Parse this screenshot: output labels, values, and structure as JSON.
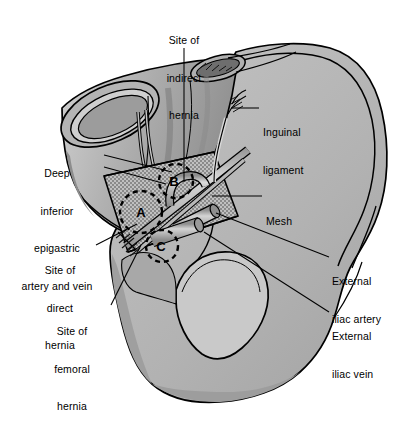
{
  "figure": {
    "kind": "medical-illustration",
    "style": "grayscale line drawing with halftone stipple"
  },
  "palette": {
    "background": "#ffffff",
    "outline": "#000000",
    "bone_fill": "#b4b4b4",
    "bone_fill_light": "#c8c8c8",
    "bone_shadow": "#9a9a9a",
    "wall_fill": "#bdbdbd",
    "wall_fill_dark": "#8e8e8e",
    "wall_fill_light": "#d8d8d8",
    "mesh_fill": "#c0c0c0",
    "vessel_fill": "#a8a8a8",
    "vessel_highlight": "#d2d2d2",
    "text": "#000000"
  },
  "labels": [
    {
      "id": "site-of-indirect-hernia",
      "lines": [
        "Site of",
        "indirect",
        "hernia"
      ],
      "align": "center",
      "x": 147,
      "y": 9,
      "w": 74,
      "leader": {
        "from": [
          184,
          48
        ],
        "to": [
          184,
          182
        ]
      }
    },
    {
      "id": "deep-inferior-epigastric-artery-and-vein",
      "lines": [
        "Deep",
        "inferior",
        "epigastric",
        "artery and vein"
      ],
      "align": "center",
      "x": 17,
      "y": 142,
      "w": 86,
      "leader": {
        "from": [
          104,
          155
        ],
        "to": [
          171,
          172
        ]
      },
      "leader2": {
        "from": [
          104,
          167
        ],
        "to": [
          166,
          184
        ]
      }
    },
    {
      "id": "site-of-direct-hernia",
      "lines": [
        "Site of",
        "direct",
        "hernia"
      ],
      "align": "center",
      "x": 25,
      "y": 239,
      "w": 70,
      "leader": {
        "from": [
          96,
          245
        ],
        "to": [
          136,
          224
        ]
      }
    },
    {
      "id": "site-of-femoral-hernia",
      "lines": [
        "Site of",
        "femoral",
        "hernia"
      ],
      "align": "center",
      "x": 35,
      "y": 300,
      "w": 74,
      "leader": {
        "from": [
          110,
          305
        ],
        "to": [
          140,
          244
        ]
      }
    },
    {
      "id": "inguinal-ligament",
      "lines": [
        "Inguinal",
        "ligament"
      ],
      "align": "left",
      "x": 263,
      "y": 101,
      "w": 72,
      "leader": {
        "from": [
          259,
          108
        ],
        "to": [
          232,
          108
        ]
      }
    },
    {
      "id": "mesh",
      "lines": [
        "Mesh"
      ],
      "align": "left",
      "x": 266,
      "y": 190,
      "w": 40,
      "leader": {
        "from": [
          262,
          196
        ],
        "to": [
          213,
          196
        ]
      }
    },
    {
      "id": "external-iliac-artery",
      "lines": [
        "External",
        "iliac artery"
      ],
      "align": "left",
      "x": 332,
      "y": 250,
      "w": 78,
      "leader": {
        "from": [
          329,
          257
        ],
        "to": [
          215,
          213
        ]
      }
    },
    {
      "id": "external-iliac-vein",
      "lines": [
        "External",
        "iliac vein"
      ],
      "align": "left",
      "x": 332,
      "y": 305,
      "w": 72,
      "leader": {
        "from": [
          329,
          312
        ],
        "to": [
          205,
          232
        ]
      }
    }
  ],
  "site_markers": [
    {
      "id": "site-marker-a",
      "letter": "A",
      "cx": 141,
      "cy": 212,
      "r": 21,
      "means": "direct hernia site"
    },
    {
      "id": "site-marker-b",
      "letter": "B",
      "cx": 176,
      "cy": 181,
      "r": 17,
      "means": "indirect hernia site"
    },
    {
      "id": "site-marker-c",
      "letter": "C",
      "cx": 162,
      "cy": 246,
      "r": 16,
      "means": "femoral hernia site"
    }
  ]
}
